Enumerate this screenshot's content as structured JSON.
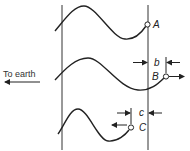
{
  "diagram": {
    "direction_label": "To earth",
    "points": [
      {
        "id": "A",
        "label": "A"
      },
      {
        "id": "B",
        "label": "B"
      },
      {
        "id": "C",
        "label": "C"
      }
    ],
    "dimensions": [
      {
        "id": "b",
        "label": "b"
      },
      {
        "id": "c",
        "label": "c"
      }
    ],
    "colors": {
      "line": "#222222",
      "background": "#ffffff"
    }
  }
}
